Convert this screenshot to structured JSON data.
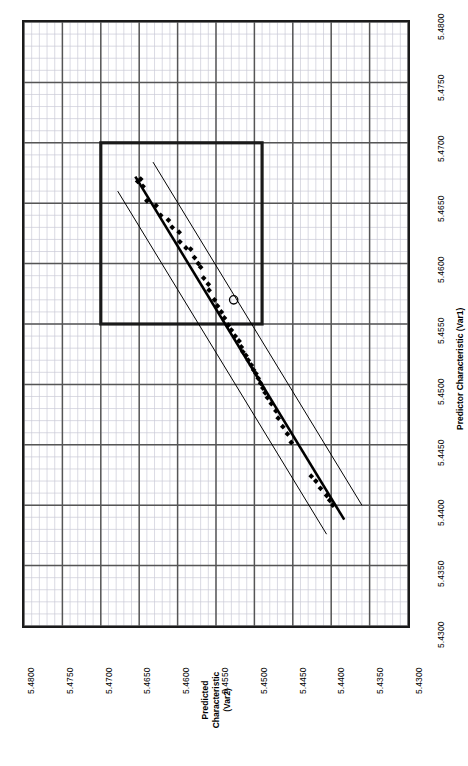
{
  "chart_data": {
    "type": "scatter",
    "title": "",
    "orientation": "rotated-90",
    "xlabel": "Predictor Characteristic (Var1)",
    "ylabel": "Predicted Characteristic (Var2)",
    "ylabel_lines": [
      "Predicted",
      "Characteristic",
      "(Var2)"
    ],
    "xlim": [
      5.43,
      5.48
    ],
    "ylim": [
      5.43,
      5.48
    ],
    "x_ticks": [
      "5.4800",
      "5.4750",
      "5.4700",
      "5.4650",
      "5.4600",
      "5.4550",
      "5.4500",
      "5.4450",
      "5.4400",
      "5.4350",
      "5.4300"
    ],
    "y_ticks": [
      "5.4800",
      "5.4750",
      "5.4700",
      "5.4650",
      "5.4600",
      "5.4550",
      "5.4500",
      "5.4450",
      "5.4400",
      "5.4350",
      "5.4300"
    ],
    "x_tick_values": [
      5.48,
      5.475,
      5.47,
      5.465,
      5.46,
      5.455,
      5.45,
      5.445,
      5.44,
      5.435,
      5.43
    ],
    "y_tick_values": [
      5.48,
      5.475,
      5.47,
      5.465,
      5.46,
      5.455,
      5.45,
      5.445,
      5.44,
      5.435,
      5.43
    ],
    "grid": true,
    "minor_grid": true,
    "minor_divisions": 5,
    "legend": "none",
    "colors": {
      "axis": "#1a1a1a",
      "major_grid": "#555555",
      "minor_grid": "#c9c9d6",
      "marker": "#000000",
      "fit_line": "#000000",
      "band_line": "#000000",
      "spec_box": "#1a1a1a",
      "background": "#ffffff"
    },
    "series": [
      {
        "name": "observations",
        "marker": "filled-diamond",
        "points": [
          [
            5.4668,
            5.4652
          ],
          [
            5.467,
            5.4648
          ],
          [
            5.4664,
            5.4645
          ],
          [
            5.4652,
            5.464
          ],
          [
            5.4648,
            5.4628
          ],
          [
            5.464,
            5.4622
          ],
          [
            5.4636,
            5.4612
          ],
          [
            5.463,
            5.4607
          ],
          [
            5.4626,
            5.4598
          ],
          [
            5.4618,
            5.4597
          ],
          [
            5.4613,
            5.4589
          ],
          [
            5.4612,
            5.4583
          ],
          [
            5.4605,
            5.4578
          ],
          [
            5.46,
            5.4573
          ],
          [
            5.4597,
            5.457
          ],
          [
            5.4588,
            5.4566
          ],
          [
            5.4583,
            5.456
          ],
          [
            5.4578,
            5.4559
          ],
          [
            5.457,
            5.4552
          ],
          [
            5.4565,
            5.4548
          ],
          [
            5.456,
            5.4543
          ],
          [
            5.4555,
            5.4539
          ],
          [
            5.4549,
            5.4534
          ],
          [
            5.4545,
            5.453
          ],
          [
            5.454,
            5.4525
          ],
          [
            5.4536,
            5.452
          ],
          [
            5.4531,
            5.4517
          ],
          [
            5.4527,
            5.4515
          ],
          [
            5.4524,
            5.4511
          ],
          [
            5.452,
            5.4508
          ],
          [
            5.4516,
            5.4504
          ],
          [
            5.4512,
            5.4501
          ],
          [
            5.4509,
            5.4498
          ],
          [
            5.4505,
            5.4495
          ],
          [
            5.4501,
            5.4492
          ],
          [
            5.4497,
            5.4489
          ],
          [
            5.4493,
            5.4486
          ],
          [
            5.4489,
            5.4483
          ],
          [
            5.4484,
            5.4478
          ],
          [
            5.4478,
            5.4472
          ],
          [
            5.4472,
            5.4469
          ],
          [
            5.4465,
            5.4463
          ],
          [
            5.4459,
            5.4457
          ],
          [
            5.4452,
            5.4452
          ],
          [
            5.4424,
            5.4426
          ],
          [
            5.442,
            5.442
          ],
          [
            5.4414,
            5.4414
          ],
          [
            5.4408,
            5.4406
          ],
          [
            5.4404,
            5.4402
          ],
          [
            5.44,
            5.4398
          ]
        ]
      },
      {
        "name": "outlier",
        "marker": "open-circle",
        "points": [
          [
            5.457,
            5.4527
          ]
        ]
      }
    ],
    "fit_line": {
      "name": "regression-line",
      "from": [
        5.4672,
        5.4655
      ],
      "to": [
        5.4388,
        5.4383
      ]
    },
    "confidence_bands": [
      {
        "name": "upper-band",
        "from": [
          5.466,
          5.4678
        ],
        "to": [
          5.4376,
          5.4406
        ]
      },
      {
        "name": "lower-band",
        "from": [
          5.4684,
          5.4632
        ],
        "to": [
          5.44,
          5.436
        ]
      }
    ],
    "spec_box": {
      "name": "specification-limits-box",
      "x_range": [
        5.455,
        5.47
      ],
      "y_range": [
        5.449,
        5.47
      ]
    }
  }
}
